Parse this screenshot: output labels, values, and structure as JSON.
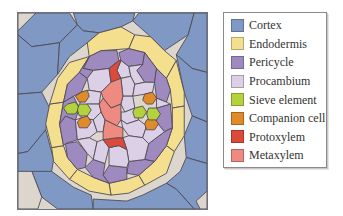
{
  "legend": {
    "items": [
      {
        "label": "Cortex",
        "color": "#7f98c4"
      },
      {
        "label": "Endodermis",
        "color": "#f3df8e"
      },
      {
        "label": "Pericycle",
        "color": "#9f8ac0"
      },
      {
        "label": "Procambium",
        "color": "#dcd0e6"
      },
      {
        "label": "Sieve element",
        "color": "#b4d23c"
      },
      {
        "label": "Companion cell",
        "color": "#e08a2a"
      },
      {
        "label": "Protoxylem",
        "color": "#dc4a3c"
      },
      {
        "label": "Metaxylem",
        "color": "#ee8a80"
      }
    ]
  },
  "figure": {
    "background_color": "#ddd6cc",
    "outline_color": "#4f4a55"
  }
}
